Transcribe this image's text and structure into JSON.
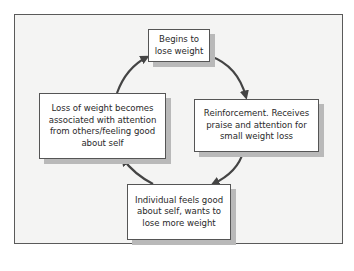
{
  "diagram": {
    "type": "cycle",
    "direction": "clockwise",
    "nodes": [
      {
        "id": "top",
        "lines": [
          "Begins to",
          "lose weight"
        ]
      },
      {
        "id": "right",
        "lines": [
          "Reinforcement. Receives",
          "praise and attention for",
          "small weight loss"
        ]
      },
      {
        "id": "bottom",
        "lines": [
          "Individual feels good",
          "about self, wants to",
          "lose more weight"
        ]
      },
      {
        "id": "left",
        "lines": [
          "Loss of weight becomes",
          "associated with attention",
          "from others/feeling good",
          "about self"
        ]
      }
    ],
    "edges": [
      {
        "from": "top",
        "to": "right"
      },
      {
        "from": "right",
        "to": "bottom"
      },
      {
        "from": "bottom",
        "to": "left"
      },
      {
        "from": "left",
        "to": "top"
      }
    ],
    "colors": {
      "frame_border": "#5a5a5a",
      "frame_background": "#f4f4f3",
      "node_background": "#ffffff",
      "node_shadow": "#b9b9b9",
      "arrow": "#444444",
      "text": "#2a2a2a"
    }
  }
}
